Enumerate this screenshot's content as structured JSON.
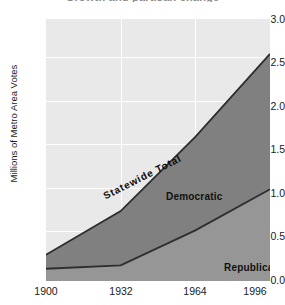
{
  "figure": {
    "title_remnant": "Growth and partisan change",
    "background_color": "#ffffff"
  },
  "chart_data": {
    "type": "area",
    "stacked": true,
    "title": "",
    "xlabel": "",
    "ylabel": "Millions of Metro Area Votes",
    "x": [
      1900,
      1932,
      1964,
      1996
    ],
    "xlim": [
      1900,
      1996
    ],
    "ylim": [
      0.0,
      3.0
    ],
    "xticks": [
      1900,
      1932,
      1964,
      1996
    ],
    "xticklabels": [
      "1900",
      "1932",
      "1964",
      "1996"
    ],
    "yticks": [
      0.0,
      0.5,
      1.0,
      1.5,
      2.0,
      2.5,
      3.0
    ],
    "yticklabels": [
      "0.0",
      "0.5",
      "1.0",
      "1.5",
      "2.0",
      "2.5",
      "3.0"
    ],
    "grid": true,
    "grid_color": "#ffffff",
    "plot_background": "#e9e9e9",
    "legend_position": "inline-annotations",
    "series": [
      {
        "name": "Republican",
        "color": "#969696",
        "outline_color": "#2e2e2e",
        "values": [
          0.14,
          0.18,
          0.58,
          1.05
        ]
      },
      {
        "name": "Democratic",
        "color": "#808080",
        "outline_color": "#2e2e2e",
        "values": [
          0.16,
          0.62,
          1.07,
          1.55
        ]
      }
    ],
    "total_series": {
      "name": "Statewide Total",
      "values": [
        0.3,
        0.8,
        1.65,
        2.6
      ]
    },
    "annotations": [
      {
        "text": "Statewide Total",
        "x": 1925,
        "y": 0.72,
        "rotation": -27
      },
      {
        "text": "Democratic",
        "x": 1945,
        "y": 1.05,
        "rotation": 0
      },
      {
        "text": "Republican",
        "x": 1972,
        "y": 0.37,
        "rotation": 0
      }
    ]
  }
}
